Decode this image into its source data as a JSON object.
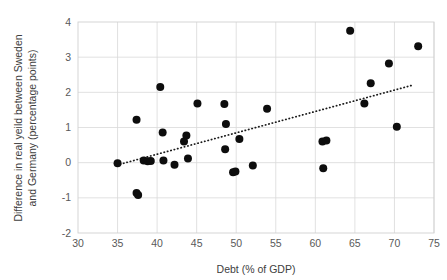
{
  "chart_data": {
    "type": "scatter",
    "title": "",
    "xlabel": "Debt (% of GDP)",
    "ylabel": "Difference in real yeild between Sweden and Germany (percentage points)",
    "ylabel_line1": "Difference in real yeild between Sweden",
    "ylabel_line2": "and Germany (percentage points)",
    "xlim": [
      30,
      75
    ],
    "ylim": [
      -2,
      4
    ],
    "xticks": [
      30,
      35,
      40,
      45,
      50,
      55,
      60,
      65,
      70,
      75
    ],
    "yticks": [
      4,
      3,
      2,
      1,
      0,
      -1,
      -2
    ],
    "xtick_labels": [
      "30",
      "35",
      "40",
      "45",
      "50",
      "55",
      "60",
      "65",
      "70",
      "75"
    ],
    "ytick_labels": [
      "4",
      "3",
      "2",
      "1",
      "0",
      "-1",
      "-2"
    ],
    "grid": "both",
    "legend": "none",
    "marker_color": "#0d0d0d",
    "marker_size": 5.2,
    "points": [
      {
        "x": 35.0,
        "y": -0.02
      },
      {
        "x": 37.4,
        "y": 1.22
      },
      {
        "x": 37.4,
        "y": -0.86
      },
      {
        "x": 37.6,
        "y": -0.92
      },
      {
        "x": 38.3,
        "y": 0.06
      },
      {
        "x": 38.8,
        "y": 0.04
      },
      {
        "x": 39.2,
        "y": 0.05
      },
      {
        "x": 40.4,
        "y": 2.15
      },
      {
        "x": 40.7,
        "y": 0.86
      },
      {
        "x": 40.8,
        "y": 0.06
      },
      {
        "x": 42.2,
        "y": -0.06
      },
      {
        "x": 43.4,
        "y": 0.6
      },
      {
        "x": 43.7,
        "y": 0.77
      },
      {
        "x": 43.9,
        "y": 0.12
      },
      {
        "x": 45.1,
        "y": 1.68
      },
      {
        "x": 48.5,
        "y": 1.67
      },
      {
        "x": 48.7,
        "y": 1.1
      },
      {
        "x": 48.6,
        "y": 0.38
      },
      {
        "x": 49.6,
        "y": -0.27
      },
      {
        "x": 49.9,
        "y": -0.25
      },
      {
        "x": 50.4,
        "y": 0.67
      },
      {
        "x": 52.1,
        "y": -0.08
      },
      {
        "x": 53.9,
        "y": 1.53
      },
      {
        "x": 60.9,
        "y": 0.6
      },
      {
        "x": 61.4,
        "y": 0.63
      },
      {
        "x": 61.0,
        "y": -0.16
      },
      {
        "x": 64.4,
        "y": 3.75
      },
      {
        "x": 66.2,
        "y": 1.68
      },
      {
        "x": 67.0,
        "y": 2.26
      },
      {
        "x": 69.3,
        "y": 2.82
      },
      {
        "x": 70.3,
        "y": 1.02
      },
      {
        "x": 73.0,
        "y": 3.31
      }
    ],
    "trendline": {
      "style": "dotted",
      "color": "#1a1a1a",
      "x_start": 34.9,
      "y_start": -0.07,
      "x_end": 72.4,
      "y_end": 2.21
    }
  }
}
